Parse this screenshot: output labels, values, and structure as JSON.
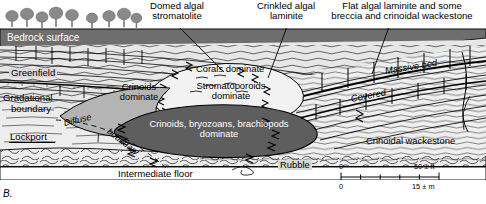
{
  "figure": {
    "panel_label": "B.",
    "type": "geologic-cross-section"
  },
  "colors": {
    "bedrock": "#6e6e6e",
    "dark_mass": "#5e5e5e",
    "mid_grey": "#9a9a9a",
    "light_grey": "#d9d9d9",
    "pale": "#ececec",
    "line": "#000000",
    "tree": "#8a8a8a",
    "white": "#ffffff"
  },
  "callouts": [
    {
      "id": "domed-algal-stromatolite",
      "line1": "Domed algal",
      "line2": "stromatolite"
    },
    {
      "id": "crinkled-algal-laminite",
      "line1": "Crinkled algal",
      "line2": "laminite"
    },
    {
      "id": "flat-algal-laminite",
      "line1": "Flat algal laminite and some",
      "line2": "breccia and crinoidal wackestone"
    }
  ],
  "unit_labels": {
    "bedrock_surface": "Bedrock surface",
    "greenfield": "Greenfield",
    "gradational_boundary_l1": "Gradational",
    "gradational_boundary_l2": "boundary",
    "lockport": "Lockport",
    "diffuse": "Diffuse",
    "boundary": "boundary",
    "intermediate_floor": "Intermediate floor",
    "rubble": "Rubble",
    "massive_bed": "Massive bed",
    "covered": "Covered",
    "crinoidal_wackestone": "Crinoidal wackestone"
  },
  "facies_labels": {
    "crinoids_dominate_l1": "Crinoids",
    "crinoids_dominate_l2": "dominate",
    "corals_dominate": "Corals dominate",
    "stromatoporoids_l1": "Stromatoporoids",
    "stromatoporoids_l2": "dominate",
    "core_l1": "Crinoids, bryozoans, brachiopods",
    "core_l2": "dominate"
  },
  "scale_bar": {
    "feet_zero": "0",
    "feet_max": "50 ± ft",
    "meters_zero": "0",
    "meters_max": "15 ± m"
  }
}
